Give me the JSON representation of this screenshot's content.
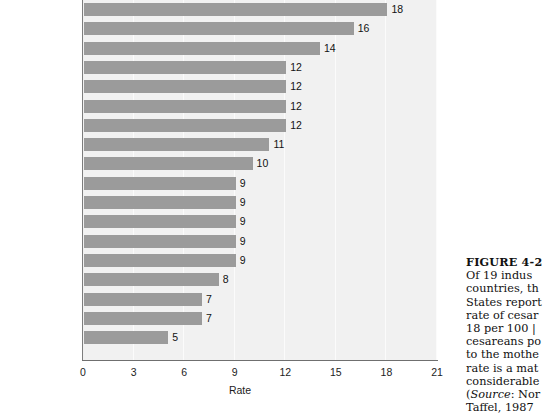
{
  "chart_data": {
    "type": "bar",
    "orientation": "horizontal",
    "title": "",
    "xlabel": "Rate",
    "ylabel": "",
    "xlim": [
      0,
      21
    ],
    "xticks": [
      "0",
      "3",
      "6",
      "9",
      "12",
      "15",
      "18",
      "21"
    ],
    "grid": true,
    "legend": "none",
    "bar_color": "#9b9b9b",
    "plot_background": "#f1f1f1",
    "categories": [
      "United States",
      "Canada",
      "Australia",
      "Sweden",
      "Scotland",
      "Denmark",
      "Bavaria",
      "France",
      "New Zealand",
      "Netherlands",
      "Portugal",
      "England and Wales",
      "Norway",
      "Hungary",
      "Japan",
      "Belgium",
      "Austria",
      "Czechoslovakia"
    ],
    "values": [
      18,
      16,
      14,
      12,
      12,
      12,
      12,
      11,
      10,
      9,
      9,
      9,
      9,
      9,
      8,
      7,
      7,
      5
    ],
    "value_labels": [
      "18",
      "16",
      "14",
      "12",
      "12",
      "12",
      "12",
      "11",
      "10",
      "9",
      "9",
      "9",
      "9",
      "9",
      "8",
      "7",
      "7",
      "5"
    ]
  },
  "caption": {
    "figure_heading": "FIGURE 4-2",
    "lines": [
      "Of 19 indus",
      "countries, th",
      "States report",
      "rate of cesar",
      "18 per 100 |",
      "cesareans po",
      "to the mothe",
      "rate is a mat",
      "considerable"
    ],
    "source_prefix": "Source",
    "source_line": ": Nor",
    "source_line2": "Taffel, 1987"
  }
}
